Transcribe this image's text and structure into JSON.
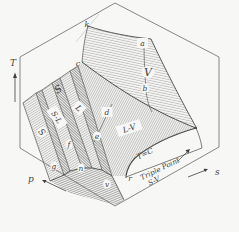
{
  "figure_type": "thermodynamic phase surface (T-s-p) textbook diagram",
  "labels": {
    "axes": {
      "T": "T",
      "p": "p",
      "s": "s"
    },
    "regions": {
      "vapor": "V",
      "liquid_vapor": "L-V",
      "solid_liquid": "S-L",
      "liquid": "L",
      "solid": "S",
      "solid_ghost": "S"
    },
    "points": {
      "a": "a",
      "b": "b",
      "c": "c",
      "d": "d",
      "e": "e",
      "f": "f",
      "g": "g",
      "n": "n",
      "r": "r",
      "v": "v",
      "k": "k"
    },
    "annotations": {
      "isotherm": "T=C",
      "triple_point_line1": "Triple Point",
      "triple_point_line2": "S-V"
    }
  },
  "colors": {
    "background": "#f7f7f5",
    "ink": "#3f3f3f",
    "edge": "#4a4a4a",
    "hatch": "#8e8e8e",
    "hatch_dark": "#6e6e6e",
    "faint": "#bdbdbd"
  }
}
